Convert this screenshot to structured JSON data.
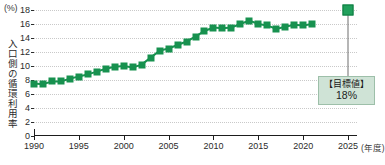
{
  "chart_data": {
    "type": "line",
    "title": "",
    "xlabel": "年度",
    "ylabel": "入口側の循環利用率",
    "unit": "(%)",
    "xlim": [
      1990,
      2026
    ],
    "ylim": [
      0,
      18
    ],
    "yticks": [
      0,
      2,
      4,
      6,
      8,
      10,
      12,
      14,
      16,
      18
    ],
    "xticks": [
      1990,
      1995,
      2000,
      2005,
      2010,
      2015,
      2020,
      2025
    ],
    "grid": true,
    "legend": "none",
    "series": [
      {
        "name": "入口側の循環利用率",
        "color": "#17914f",
        "x": [
          1990,
          1991,
          1992,
          1993,
          1994,
          1995,
          1996,
          1997,
          1998,
          1999,
          2000,
          2001,
          2002,
          2003,
          2004,
          2005,
          2006,
          2007,
          2008,
          2009,
          2010,
          2011,
          2012,
          2013,
          2014,
          2015,
          2016,
          2017,
          2018,
          2019,
          2020,
          2021
        ],
        "values": [
          7.5,
          7.4,
          7.8,
          7.8,
          8.2,
          8.5,
          8.8,
          9.2,
          9.6,
          9.9,
          10.0,
          9.8,
          10.2,
          11.2,
          12.2,
          12.5,
          13.0,
          13.5,
          14.2,
          15.0,
          15.5,
          15.4,
          15.5,
          16.0,
          16.5,
          16.0,
          15.8,
          15.3,
          15.6,
          15.9,
          15.8,
          16.0
        ]
      }
    ],
    "target": {
      "x": 2025,
      "value": 18,
      "label": "【目標値】",
      "value_label": "18%",
      "color": "#21a05c"
    }
  }
}
